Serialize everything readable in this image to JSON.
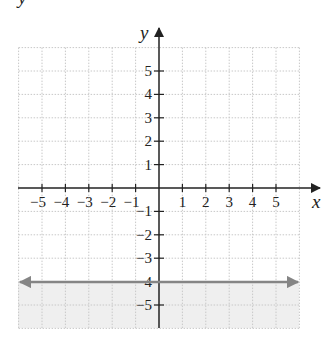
{
  "graph": {
    "corner_label": "y",
    "x_axis_label": "x",
    "y_axis_label": "y",
    "x_range": [
      -6,
      6
    ],
    "y_range": [
      -6,
      6
    ],
    "x_tick_labels": [
      "−5",
      "−4",
      "−3",
      "−2",
      "−1",
      "1",
      "2",
      "3",
      "4",
      "5"
    ],
    "x_tick_values": [
      -5,
      -4,
      -3,
      -2,
      -1,
      1,
      2,
      3,
      4,
      5
    ],
    "y_tick_labels": [
      "5",
      "4",
      "3",
      "2",
      "1",
      "−1",
      "−2",
      "−3",
      "−4",
      "−5"
    ],
    "y_tick_values": [
      5,
      4,
      3,
      2,
      1,
      -1,
      -2,
      -3,
      -4,
      -5
    ],
    "colors": {
      "axis": "#222222",
      "grid": "#c8c8c8",
      "line": "#858585",
      "shade": "#efefef"
    }
  },
  "chart_data": {
    "type": "line",
    "title": "",
    "xlabel": "x",
    "ylabel": "y",
    "xlim": [
      -6,
      6
    ],
    "ylim": [
      -6,
      6
    ],
    "grid": true,
    "series": [
      {
        "name": "y = -4",
        "equation": "y = -4",
        "x": [
          -6,
          6
        ],
        "y": [
          -4,
          -4
        ],
        "style": "solid, arrows both ends"
      }
    ],
    "shaded_region": "y <= -4 (below the line)",
    "x_ticks": [
      -5,
      -4,
      -3,
      -2,
      -1,
      1,
      2,
      3,
      4,
      5
    ],
    "y_ticks": [
      -5,
      -4,
      -3,
      -2,
      -1,
      1,
      2,
      3,
      4,
      5
    ]
  }
}
